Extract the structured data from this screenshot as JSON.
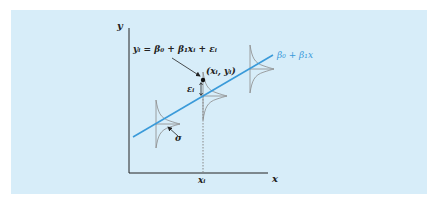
{
  "figure": {
    "background_color": "#d7edf9",
    "line_color": "#3a9ad9",
    "axis_color": "#222222",
    "curve_color": "#888888",
    "labels": {
      "y_axis": "y",
      "x_axis": "x",
      "x_i": "xᵢ",
      "regression_line": "β₀ + β₁x",
      "model_equation": "yᵢ = β₀ + β₁xᵢ + εᵢ",
      "point": "(xᵢ, yᵢ)",
      "error": "εᵢ",
      "sigma": "σ"
    }
  }
}
